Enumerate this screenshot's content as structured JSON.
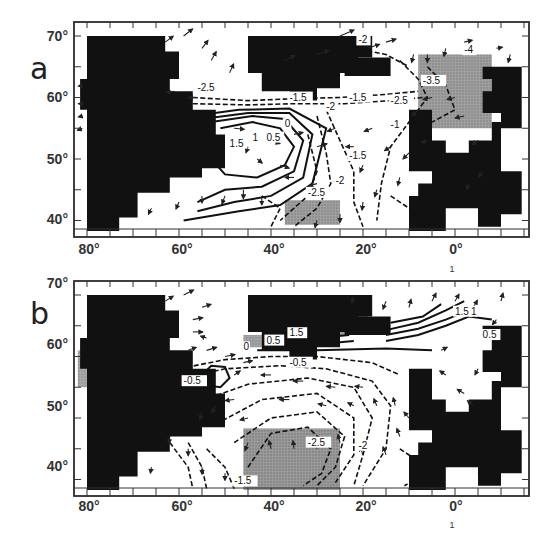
{
  "figure": {
    "panels": [
      {
        "letter": "a",
        "y_ticks": [
          "70°",
          "60°",
          "50°",
          "40°"
        ],
        "x_ticks": [
          "80°",
          "60°",
          "40°",
          "20°",
          "0°"
        ],
        "scale_vector_label": "1",
        "contour_labels": [
          "-2.5",
          "-1.5",
          "-1.5",
          "-2",
          "-2",
          "-2.5",
          "-3.5",
          "-4",
          "0",
          "0.5",
          "1",
          "1.5",
          "-1.5",
          "-2",
          "-2.5",
          "-1"
        ],
        "shaded_regions": [
          "north-east (near 0°-10°E, 55°-67°N)",
          "south-central (near 30°-40°W, 40°-43°N)"
        ]
      },
      {
        "letter": "b",
        "y_ticks": [
          "70°",
          "60°",
          "50°",
          "40°"
        ],
        "x_ticks": [
          "80°",
          "60°",
          "40°",
          "20°",
          "0°"
        ],
        "scale_vector_label": "1",
        "contour_labels": [
          "1.5",
          "0.5",
          "0",
          "-0.5",
          "-0.5",
          "1.5",
          "1",
          "0.5",
          "-2.5",
          "-2",
          "-1.5"
        ],
        "shaded_regions": [
          "north-central (near 35°-20°W, 60°-67°N)",
          "west coast (near 80°W, 55°-61°N)",
          "south-central (near 45°-25°W, 38°-48°N)"
        ]
      }
    ],
    "caption_visible": "(caption text cut off at bottom edge, illegible)"
  },
  "chart_data": [
    {
      "type": "heatmap",
      "title": "a",
      "xlabel": "Longitude",
      "ylabel": "Latitude",
      "x_tick_labels": [
        "80°",
        "60°",
        "40°",
        "20°",
        "0°"
      ],
      "y_tick_labels": [
        "70°",
        "60°",
        "50°",
        "40°"
      ],
      "xlim": [
        -83,
        16
      ],
      "ylim": [
        38,
        72
      ],
      "grid": false,
      "legend": "reference vector arrow labelled 1",
      "contours": {
        "solid_positive": [
          0,
          0.5,
          1,
          1.5
        ],
        "dashed_negative": [
          -1,
          -1.5,
          -2,
          -2.5,
          -3.5,
          -4
        ],
        "max_center": {
          "lon": -45,
          "lat": 52,
          "value": 1.5
        },
        "min_northeast": {
          "lon": 2,
          "lat": 64,
          "value": -4
        }
      },
      "annotations": [
        "-2.5 near 57W 60N",
        "-1.5 near 35W 59N",
        "-1.5 near 22W 59N",
        "-2 near 21W 68N",
        "-2.5 near 13W 59N",
        "-3.5 near 6W 62N",
        "-4 near 3E 67N",
        "0 near 38W 55N",
        "0.5 near 40W 53N",
        "1 near 43W 53N",
        "1.5 near 47W 52N",
        "-1.5 near 23W 50N",
        "-2 near 26W 46N",
        "-2.5 near 32W 44N",
        "-1 near 14W 55N"
      ]
    },
    {
      "type": "heatmap",
      "title": "b",
      "xlabel": "Longitude",
      "ylabel": "Latitude",
      "x_tick_labels": [
        "80°",
        "60°",
        "40°",
        "20°",
        "0°"
      ],
      "y_tick_labels": [
        "70°",
        "60°",
        "50°",
        "40°"
      ],
      "xlim": [
        -83,
        16
      ],
      "ylim": [
        38,
        72
      ],
      "grid": false,
      "legend": "reference vector arrow labelled 1",
      "contours": {
        "solid_positive": [
          0,
          0.5,
          1,
          1.5
        ],
        "dashed_negative": [
          -0.5,
          -1,
          -1.5,
          -2,
          -2.5
        ],
        "min_center": {
          "lon": -33,
          "lat": 44,
          "value": -2.5
        }
      },
      "annotations": [
        "1.5 near 35W 63N",
        "0.5 near 40W 62N",
        "0 near 45W 61N",
        "-0.5 near 35W 58N",
        "-0.5 near 55W 56N",
        "1.5 near 3W 66N",
        "1 near 1W 66N",
        "0.5 near 6E 63N",
        "-2.5 near 31W 46N",
        "-2 near 24W 45N",
        "-1.5 near 47W 39N"
      ]
    }
  ]
}
